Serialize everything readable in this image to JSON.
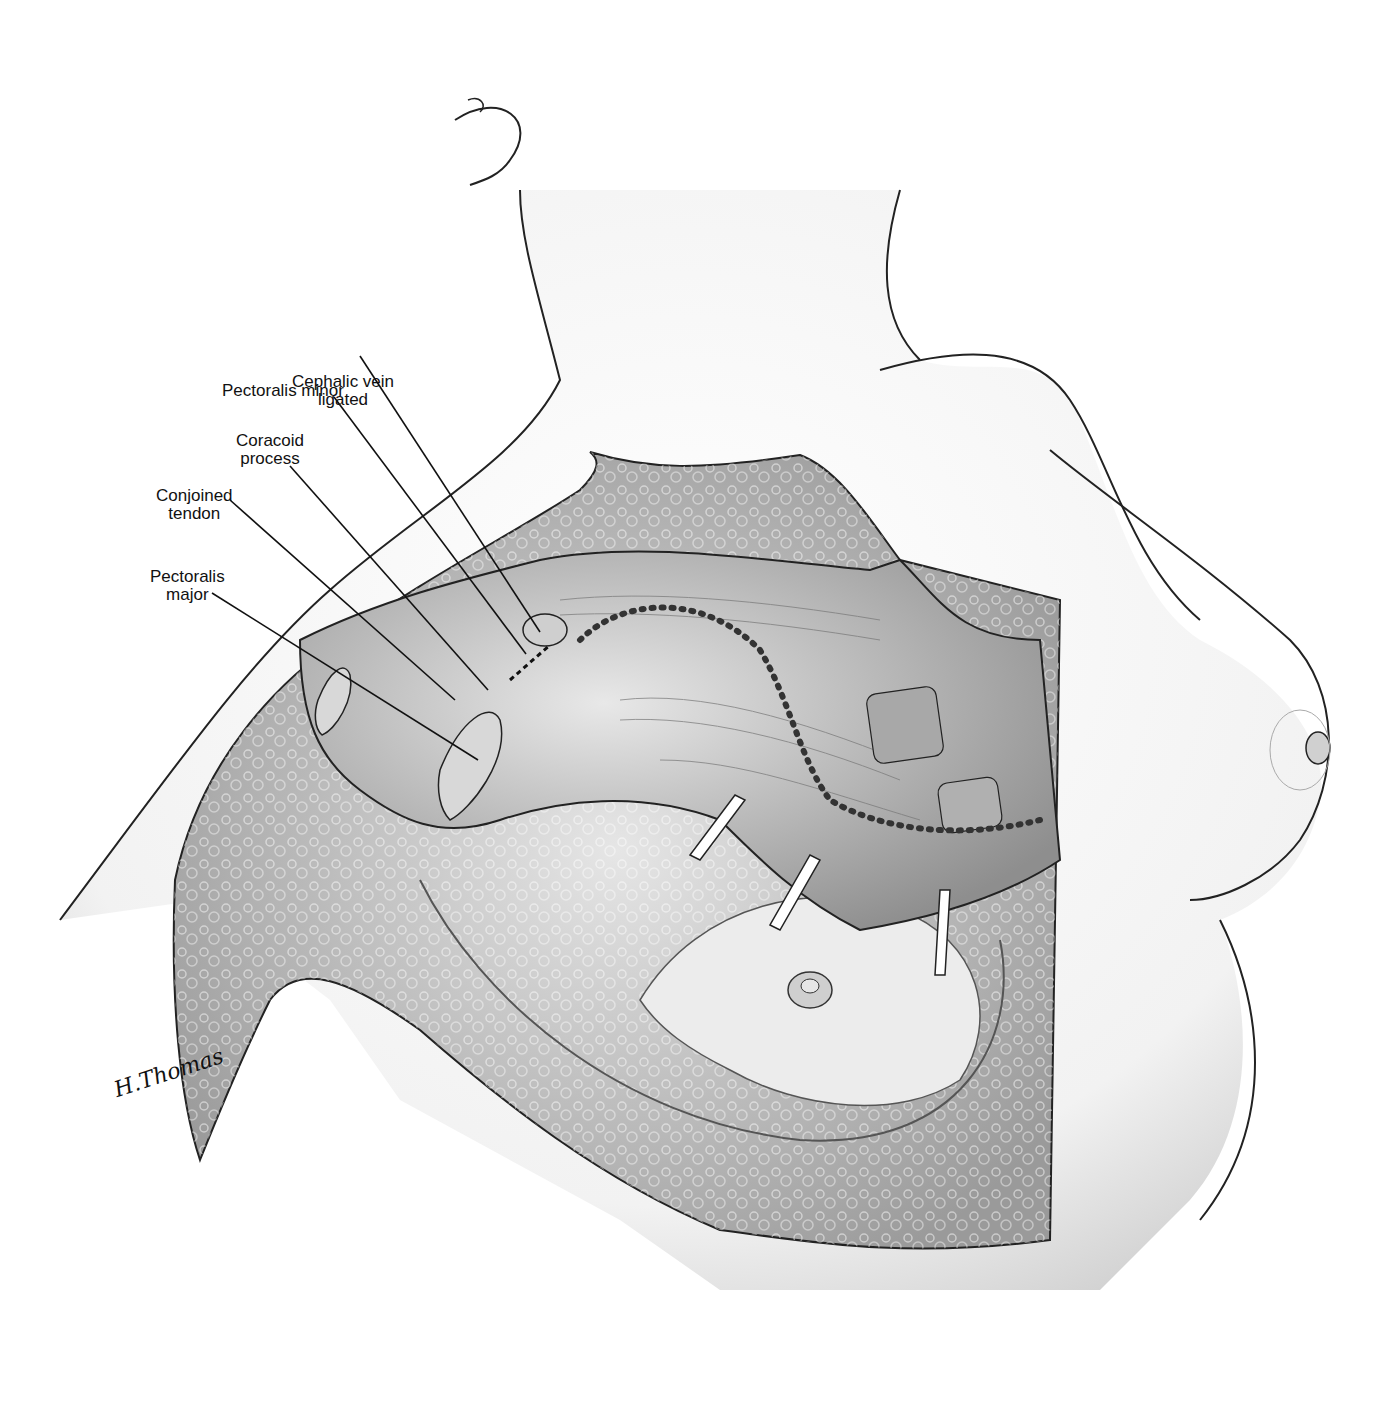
{
  "figure": {
    "type": "surgical anatomical illustration",
    "signature": "H.Thomas"
  },
  "labels": [
    {
      "id": "cephalic-vein",
      "text": "Cephalic vein\nligated",
      "x": 292,
      "y": 373
    },
    {
      "id": "pectoralis-minor",
      "text": "Pectoralis minor",
      "x": 222,
      "y": 382
    },
    {
      "id": "coracoid-process",
      "text": "Coracoid\nprocess",
      "x": 236,
      "y": 432
    },
    {
      "id": "conjoined-tendon",
      "text": "Conjoined\ntendon",
      "x": 156,
      "y": 487
    },
    {
      "id": "pectoralis-major",
      "text": "Pectoralis\nmajor",
      "x": 150,
      "y": 568
    }
  ],
  "colors": {
    "background": "#ffffff",
    "outline": "#222222",
    "shade": "#bdbdbd",
    "tissue": "#d9d9d9"
  }
}
